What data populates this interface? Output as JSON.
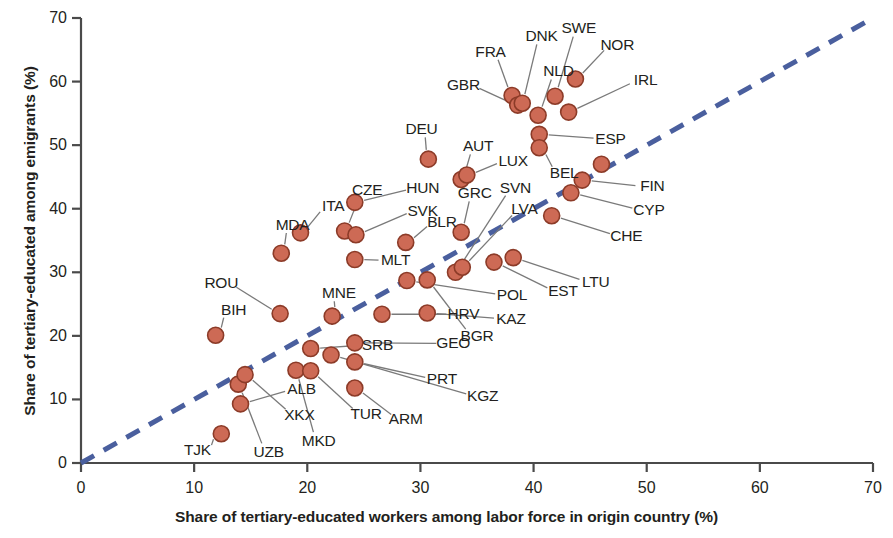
{
  "chart_data": {
    "type": "scatter",
    "title": "",
    "xlabel": "Share of tertiary-educated workers among labor force in origin country (%)",
    "ylabel": "Share of tertiary-educated among emigrants (%)",
    "xlim": [
      0,
      70
    ],
    "ylim": [
      0,
      70
    ],
    "xticks": [
      0,
      10,
      20,
      30,
      40,
      50,
      60,
      70
    ],
    "yticks": [
      0,
      10,
      20,
      30,
      40,
      50,
      60,
      70
    ],
    "grid": false,
    "legend": null,
    "reference_line": {
      "name": "45-degree line",
      "style": "dashed",
      "color": "#4a5f9e",
      "from": [
        0,
        0
      ],
      "to": [
        70,
        70
      ]
    },
    "marker": {
      "shape": "circle",
      "fill": "#cd6a55",
      "edge": "#8c3b28"
    },
    "points": [
      {
        "label": "TJK",
        "x": 12.4,
        "y": 4.6,
        "lx": 10.3,
        "ly": 2.0
      },
      {
        "label": "UZB",
        "x": 13.9,
        "y": 12.4,
        "lx": 16.6,
        "ly": 1.8
      },
      {
        "label": "XKX",
        "x": 14.5,
        "y": 13.9,
        "lx": 19.3,
        "ly": 7.6
      },
      {
        "label": "ALB",
        "x": 14.1,
        "y": 9.3,
        "lx": 19.5,
        "ly": 11.6
      },
      {
        "label": "MKD",
        "x": 19.0,
        "y": 14.6,
        "lx": 21.0,
        "ly": 3.5
      },
      {
        "label": "TUR",
        "x": 20.3,
        "y": 14.5,
        "lx": 25.2,
        "ly": 7.7
      },
      {
        "label": "ARM",
        "x": 24.2,
        "y": 11.8,
        "lx": 28.7,
        "ly": 6.9
      },
      {
        "label": "KGZ",
        "x": 22.1,
        "y": 17.0,
        "lx": 35.5,
        "ly": 10.5
      },
      {
        "label": "PRT",
        "x": 24.2,
        "y": 15.9,
        "lx": 31.9,
        "ly": 13.2
      },
      {
        "label": "GEO",
        "x": 24.2,
        "y": 18.9,
        "lx": 32.9,
        "ly": 18.8
      },
      {
        "label": "SRB",
        "x": 20.3,
        "y": 18.0,
        "lx": 26.2,
        "ly": 18.6
      },
      {
        "label": "MNE",
        "x": 22.2,
        "y": 23.1,
        "lx": 22.8,
        "ly": 26.8
      },
      {
        "label": "BIH",
        "x": 11.9,
        "y": 20.1,
        "lx": 13.5,
        "ly": 24.0
      },
      {
        "label": "ROU",
        "x": 17.6,
        "y": 23.5,
        "lx": 12.4,
        "ly": 28.3
      },
      {
        "label": "HRV",
        "x": 26.6,
        "y": 23.4,
        "lx": 33.8,
        "ly": 23.4
      },
      {
        "label": "BGR",
        "x": 30.6,
        "y": 28.8,
        "lx": 35.0,
        "ly": 20.0
      },
      {
        "label": "KAZ",
        "x": 30.6,
        "y": 23.6,
        "lx": 38.0,
        "ly": 22.7
      },
      {
        "label": "POL",
        "x": 28.8,
        "y": 28.7,
        "lx": 38.1,
        "ly": 26.4
      },
      {
        "label": "MDA",
        "x": 17.7,
        "y": 33.0,
        "lx": 18.7,
        "ly": 37.5
      },
      {
        "label": "ITA",
        "x": 19.4,
        "y": 36.2,
        "lx": 22.3,
        "ly": 40.4
      },
      {
        "label": "CZE",
        "x": 23.3,
        "y": 36.5,
        "lx": 25.3,
        "ly": 43.0
      },
      {
        "label": "SVK",
        "x": 24.3,
        "y": 35.9,
        "lx": 30.2,
        "ly": 39.7
      },
      {
        "label": "HUN",
        "x": 24.2,
        "y": 41.0,
        "lx": 30.2,
        "ly": 43.2
      },
      {
        "label": "MLT",
        "x": 24.2,
        "y": 32.0,
        "lx": 27.8,
        "ly": 31.9
      },
      {
        "label": "BLR",
        "x": 28.7,
        "y": 34.7,
        "lx": 31.9,
        "ly": 37.9
      },
      {
        "label": "DEU",
        "x": 30.7,
        "y": 47.8,
        "lx": 30.1,
        "ly": 52.6
      },
      {
        "label": "GRC",
        "x": 33.6,
        "y": 36.3,
        "lx": 34.8,
        "ly": 42.5
      },
      {
        "label": "AUT",
        "x": 33.6,
        "y": 44.6,
        "lx": 35.1,
        "ly": 49.8
      },
      {
        "label": "LUX",
        "x": 34.1,
        "y": 45.3,
        "lx": 38.2,
        "ly": 47.5
      },
      {
        "label": "SVN",
        "x": 33.1,
        "y": 30.0,
        "lx": 38.4,
        "ly": 43.2
      },
      {
        "label": "LVA",
        "x": 33.7,
        "y": 30.8,
        "lx": 39.2,
        "ly": 39.9
      },
      {
        "label": "EST",
        "x": 36.5,
        "y": 31.6,
        "lx": 42.6,
        "ly": 27.0
      },
      {
        "label": "LTU",
        "x": 38.2,
        "y": 32.3,
        "lx": 45.5,
        "ly": 28.5
      },
      {
        "label": "FRA",
        "x": 38.1,
        "y": 57.8,
        "lx": 36.2,
        "ly": 64.7
      },
      {
        "label": "GBR",
        "x": 38.6,
        "y": 56.3,
        "lx": 33.8,
        "ly": 59.4
      },
      {
        "label": "DNK",
        "x": 39.0,
        "y": 56.6,
        "lx": 40.7,
        "ly": 67.2
      },
      {
        "label": "NLD",
        "x": 40.4,
        "y": 54.7,
        "lx": 42.2,
        "ly": 61.6
      },
      {
        "label": "SWE",
        "x": 41.9,
        "y": 57.7,
        "lx": 44.0,
        "ly": 68.4
      },
      {
        "label": "NOR",
        "x": 43.7,
        "y": 60.4,
        "lx": 47.4,
        "ly": 65.8
      },
      {
        "label": "IRL",
        "x": 43.1,
        "y": 55.2,
        "lx": 49.9,
        "ly": 60.2
      },
      {
        "label": "ESP",
        "x": 40.5,
        "y": 51.7,
        "lx": 46.8,
        "ly": 51.0
      },
      {
        "label": "BEL",
        "x": 40.5,
        "y": 49.6,
        "lx": 42.7,
        "ly": 45.6
      },
      {
        "label": "CHE",
        "x": 41.6,
        "y": 38.9,
        "lx": 48.2,
        "ly": 35.7
      },
      {
        "label": "CYP",
        "x": 43.3,
        "y": 42.5,
        "lx": 50.2,
        "ly": 39.8
      },
      {
        "label": "FIN",
        "x": 44.3,
        "y": 44.5,
        "lx": 50.5,
        "ly": 43.5
      },
      {
        "label": "MLT2",
        "x": 46.0,
        "y": 47.0,
        "lx": null,
        "ly": null
      }
    ]
  },
  "labels": {
    "x_axis": "Share of tertiary-educated workers among labor force in origin country (%)",
    "y_axis": "Share of tertiary-educated among emigrants (%)"
  }
}
